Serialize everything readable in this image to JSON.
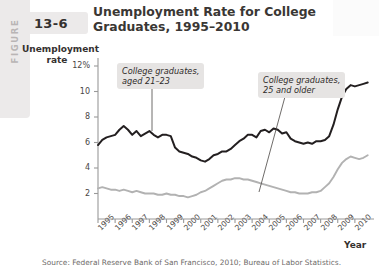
{
  "figure": {
    "word": "FIGURE",
    "number": "13-6"
  },
  "title": "Unemployment Rate for College Graduates, 1995–2010",
  "source": "Source: Federal Reserve Bank of San Francisco, 2010; Bureau of Labor Statistics.",
  "annotations": {
    "young": "College graduates,\naged 21–23",
    "young_line1": "College graduates,",
    "young_line2": "aged 21–23",
    "older_line1": "College graduates,",
    "older_line2": "25 and older"
  },
  "colors": {
    "series_young": "#231f20",
    "series_older": "#b2b2b2",
    "axis": "#999999",
    "callout_bg": "#e6e4e3",
    "figure_tab": "#eceaea",
    "text": "#35312f"
  },
  "chart_data": {
    "type": "line",
    "title": "Unemployment Rate for College Graduates, 1995–2010",
    "xlabel": "Year",
    "ylabel": "Unemployment rate",
    "ylabel_line1": "Unemployment",
    "ylabel_line2": "rate",
    "grid": false,
    "legend_position": "inline-annotations",
    "ylim": [
      0,
      12
    ],
    "xlim": [
      1995,
      2011
    ],
    "ytick_labels": [
      "12%",
      "10",
      "8",
      "6",
      "4",
      "2"
    ],
    "ytick_values": [
      12,
      10,
      8,
      6,
      4,
      2
    ],
    "xtick_labels": [
      "1995",
      "1996",
      "1997",
      "1998",
      "1999",
      "2000",
      "2001",
      "2002",
      "2003",
      "2004",
      "2005",
      "2006",
      "2007",
      "2008",
      "2009",
      "2010"
    ],
    "xtick_values": [
      1995,
      1996,
      1997,
      1998,
      1999,
      2000,
      2001,
      2002,
      2003,
      2004,
      2005,
      2006,
      2007,
      2008,
      2009,
      2010
    ],
    "series": [
      {
        "name": "College graduates, aged 21–23",
        "color": "#231f20",
        "x": [
          1995.0,
          1995.25,
          1995.5,
          1995.75,
          1996.0,
          1996.25,
          1996.5,
          1996.75,
          1997.0,
          1997.25,
          1997.5,
          1997.75,
          1998.0,
          1998.25,
          1998.5,
          1998.75,
          1999.0,
          1999.25,
          1999.5,
          1999.75,
          2000.0,
          2000.25,
          2000.5,
          2000.75,
          2001.0,
          2001.25,
          2001.5,
          2001.75,
          2002.0,
          2002.25,
          2002.5,
          2002.75,
          2003.0,
          2003.25,
          2003.5,
          2003.75,
          2004.0,
          2004.25,
          2004.5,
          2004.75,
          2005.0,
          2005.25,
          2005.5,
          2005.75,
          2006.0,
          2006.25,
          2006.5,
          2006.75,
          2007.0,
          2007.25,
          2007.5,
          2007.75,
          2008.0,
          2008.25,
          2008.5,
          2008.75,
          2009.0,
          2009.25,
          2009.5,
          2009.75,
          2010.0,
          2010.25,
          2010.5,
          2010.75
        ],
        "y": [
          5.8,
          6.2,
          6.4,
          6.5,
          6.6,
          7.0,
          7.3,
          7.0,
          6.6,
          6.9,
          6.5,
          6.7,
          6.9,
          6.6,
          6.4,
          6.6,
          6.6,
          6.5,
          5.6,
          5.3,
          5.2,
          5.1,
          4.9,
          4.8,
          4.6,
          4.5,
          4.7,
          5.0,
          5.1,
          5.3,
          5.3,
          5.5,
          5.8,
          6.1,
          6.3,
          6.6,
          6.6,
          6.4,
          6.9,
          7.0,
          6.8,
          7.1,
          7.0,
          6.7,
          6.8,
          6.3,
          6.1,
          6.0,
          5.9,
          6.0,
          5.9,
          6.1,
          6.1,
          6.2,
          6.5,
          7.4,
          8.6,
          9.6,
          10.2,
          10.5,
          10.4,
          10.5,
          10.6,
          10.7
        ]
      },
      {
        "name": "College graduates, 25 and older",
        "color": "#b2b2b2",
        "x": [
          1995.0,
          1995.25,
          1995.5,
          1995.75,
          1996.0,
          1996.25,
          1996.5,
          1996.75,
          1997.0,
          1997.25,
          1997.5,
          1997.75,
          1998.0,
          1998.25,
          1998.5,
          1998.75,
          1999.0,
          1999.25,
          1999.5,
          1999.75,
          2000.0,
          2000.25,
          2000.5,
          2000.75,
          2001.0,
          2001.25,
          2001.5,
          2001.75,
          2002.0,
          2002.25,
          2002.5,
          2002.75,
          2003.0,
          2003.25,
          2003.5,
          2003.75,
          2004.0,
          2004.25,
          2004.5,
          2004.75,
          2005.0,
          2005.25,
          2005.5,
          2005.75,
          2006.0,
          2006.25,
          2006.5,
          2006.75,
          2007.0,
          2007.25,
          2007.5,
          2007.75,
          2008.0,
          2008.25,
          2008.5,
          2008.75,
          2009.0,
          2009.25,
          2009.5,
          2009.75,
          2010.0,
          2010.25,
          2010.5,
          2010.75
        ],
        "y": [
          2.4,
          2.5,
          2.4,
          2.3,
          2.3,
          2.2,
          2.3,
          2.2,
          2.1,
          2.2,
          2.1,
          2.0,
          2.0,
          2.0,
          1.9,
          1.9,
          2.0,
          1.9,
          1.9,
          1.8,
          1.8,
          1.7,
          1.8,
          1.9,
          2.1,
          2.2,
          2.4,
          2.6,
          2.8,
          3.0,
          3.1,
          3.1,
          3.2,
          3.2,
          3.1,
          3.1,
          3.0,
          2.9,
          2.8,
          2.7,
          2.6,
          2.5,
          2.4,
          2.3,
          2.2,
          2.1,
          2.1,
          2.0,
          2.0,
          2.0,
          2.1,
          2.1,
          2.2,
          2.5,
          2.8,
          3.3,
          3.9,
          4.4,
          4.7,
          4.9,
          4.8,
          4.7,
          4.8,
          5.0
        ]
      }
    ]
  }
}
